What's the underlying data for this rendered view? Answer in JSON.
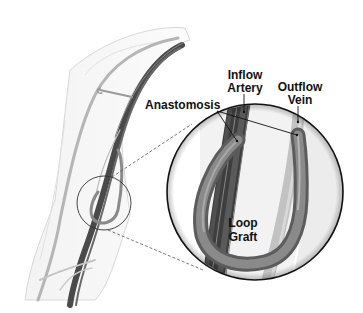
{
  "diagram": {
    "colors": {
      "background": "#ffffff",
      "skin_outline": "#d6d6d6",
      "artery": "#555555",
      "artery_dark": "#3a3a3a",
      "vein": "#aaaaaa",
      "graft": "#7a7a7a",
      "circle_stroke": "#111111",
      "label_text": "#111111"
    },
    "labels": {
      "inflow_artery": {
        "line1": "Inflow",
        "line2": "Artery"
      },
      "outflow_vein": {
        "line1": "Outflow",
        "line2": "Vein"
      },
      "anastomosis": "Anastomosis",
      "loop_graft": {
        "line1": "Loop",
        "line2": "Graft"
      }
    },
    "callouts": {
      "small_circle": {
        "cx": 104,
        "cy": 203,
        "r": 27
      },
      "magnified_circle": {
        "cx": 255,
        "cy": 192,
        "r": 88
      }
    }
  }
}
